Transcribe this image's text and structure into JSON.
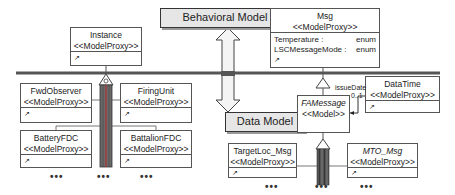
{
  "layers": {
    "behavioral_label": "Behavioral Model",
    "data_label": "Data Model"
  },
  "classes": {
    "instance": {
      "name": "Instance",
      "stereotype": "<<ModelProxy>>",
      "pin": "↗"
    },
    "msg": {
      "name": "Msg",
      "stereotype": "<<ModelProxy>>",
      "attributes": [
        {
          "name": "Temperature :",
          "type": "enum"
        },
        {
          "name": "LSCMessageMode :",
          "type": "enum"
        }
      ],
      "pin": "↗"
    },
    "fwd_observer": {
      "name": "FwdObserver",
      "stereotype": "<<ModelProxy>>",
      "pin": "↗"
    },
    "firing_unit": {
      "name": "FiringUnit",
      "stereotype": "<<ModelProxy>>",
      "pin": "↗"
    },
    "battery_fdc": {
      "name": "BatteryFDC",
      "stereotype": "<<ModelProxy>>",
      "pin": "↗"
    },
    "battalion_fdc": {
      "name": "BattalionFDC",
      "stereotype": "<<ModelProxy>>",
      "pin": "↗"
    },
    "data_time": {
      "name": "DataTime",
      "stereotype": "<<ModelProxy>>",
      "pin": "↗"
    },
    "fa_message": {
      "name": "FAMessage",
      "stereotype": "<<Model>>"
    },
    "target_loc_msg": {
      "name": "TargetLoc_Msg",
      "stereotype": "<<ModelProxy>>",
      "pin": "↗"
    },
    "mto_msg": {
      "name": "MTO_Msg",
      "stereotype": "<<ModelProxy>>",
      "pin": "↗"
    }
  },
  "association": {
    "role": "issueDate",
    "multiplicity": "0..1"
  },
  "ellipsis": "•••"
}
